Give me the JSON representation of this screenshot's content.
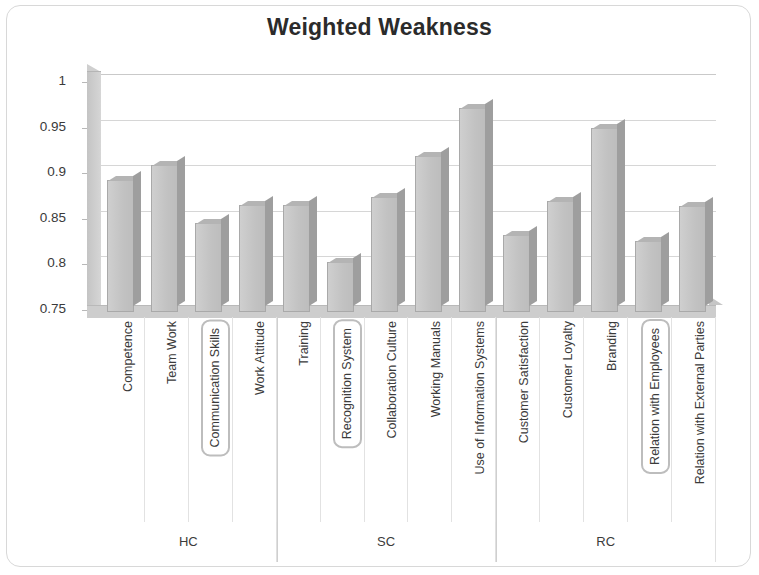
{
  "chart_data": {
    "type": "bar",
    "title": "Weighted Weakness",
    "xlabel": "",
    "ylabel": "",
    "ylim": [
      0.75,
      1
    ],
    "ytick_labels": [
      "1",
      "0.95",
      "0.9",
      "0.85",
      "0.8",
      "0.75"
    ],
    "ytick_values": [
      1,
      0.95,
      0.9,
      0.85,
      0.8,
      0.75
    ],
    "grid": true,
    "legend": "none",
    "style": "3d-column",
    "categories": [
      "Competence",
      "Team Work",
      "Communication Skills",
      "Work Attitude",
      "Training",
      "Recognition System",
      "Collaboration Culture",
      "Working Manuals",
      "Use of Information Systems",
      "Customer Satisfaction",
      "Customer Loyalty",
      "Branding",
      "Relation with Employees",
      "Relation with External Parties"
    ],
    "values": [
      0.892,
      0.909,
      0.845,
      0.865,
      0.865,
      0.803,
      0.874,
      0.919,
      0.972,
      0.832,
      0.87,
      0.95,
      0.826,
      0.864
    ],
    "highlighted_categories": [
      "Communication Skills",
      "Recognition System",
      "Relation with Employees"
    ],
    "groups": [
      {
        "label": "HC",
        "categories": [
          "Competence",
          "Team Work",
          "Communication Skills",
          "Work Attitude"
        ]
      },
      {
        "label": "SC",
        "categories": [
          "Training",
          "Recognition System",
          "Collaboration Culture",
          "Working Manuals",
          "Use of Information Systems"
        ]
      },
      {
        "label": "RC",
        "categories": [
          "Customer Satisfaction",
          "Customer Loyalty",
          "Branding",
          "Relation with Employees",
          "Relation with External Parties"
        ]
      }
    ],
    "colors": {
      "bar_fill": "#c6c6c6",
      "bar_edge": "#a9a9a9",
      "grid": "#d6d6d6",
      "text": "#3b3b3b",
      "title": "#2b2b2b",
      "highlight_box": "#bdbdbd"
    }
  }
}
